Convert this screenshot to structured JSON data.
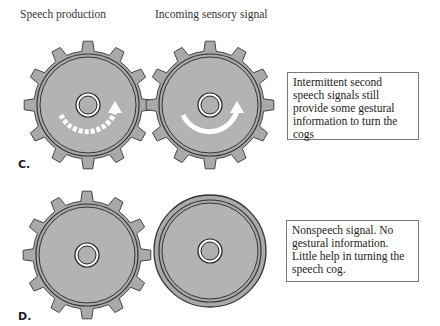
{
  "headers": {
    "left": "Speech production",
    "right": "Incoming sensory signal"
  },
  "panels": [
    {
      "label": "C.",
      "note": "Intermittent second speech signals still provide some gestural information to turn the cogs",
      "left_element": "cog with dashed rotation arrow",
      "right_element": "cog with solid rotation arrow"
    },
    {
      "label": "D.",
      "note": "Nonspeech signal. No gestural information. Little help in turning the speech cog.",
      "left_element": "cog without arrow",
      "right_element": "smooth disc without teeth"
    }
  ],
  "colors": {
    "gear_fill": "#a9a9a9",
    "gear_stroke": "#444444",
    "arrow": "#ffffff",
    "background": "#ffffff"
  }
}
